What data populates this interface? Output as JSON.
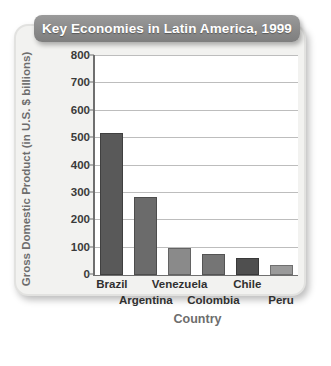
{
  "chart_data": {
    "type": "bar",
    "title": "Key Economies in Latin America, 1999",
    "xlabel": "Country",
    "ylabel": "Gross Domestic Product (in U.S. $ billions)",
    "categories": [
      "Brazil",
      "Argentina",
      "Venezuela",
      "Colombia",
      "Chile",
      "Peru"
    ],
    "values": [
      520,
      285,
      97,
      78,
      62,
      38
    ],
    "ylim": [
      0,
      800
    ],
    "ytick_step": 100,
    "yticks": [
      "800",
      "700",
      "600",
      "500",
      "400",
      "300",
      "200",
      "100",
      "0"
    ],
    "ytick_values": [
      800,
      700,
      600,
      500,
      400,
      300,
      200,
      100,
      0
    ],
    "grid": true,
    "legend": "none",
    "bar_colors": [
      "#595959",
      "#6b6b6b",
      "#8a8a8a",
      "#757575",
      "#4f4f4f",
      "#9a9a9a"
    ],
    "label_rows": [
      0,
      1,
      0,
      1,
      0,
      1
    ]
  },
  "style": {
    "banner_color": "#8a8a8a",
    "banner_text_color": "#ffffff",
    "frame_color": "#f2f2f0",
    "plot_background": "#ffffff",
    "axis_color": "#6f6f6f",
    "gridline_color": "#bdbdbd",
    "axis_title_color": "#6d6d6d",
    "tick_label_color": "#3a3a3a"
  }
}
